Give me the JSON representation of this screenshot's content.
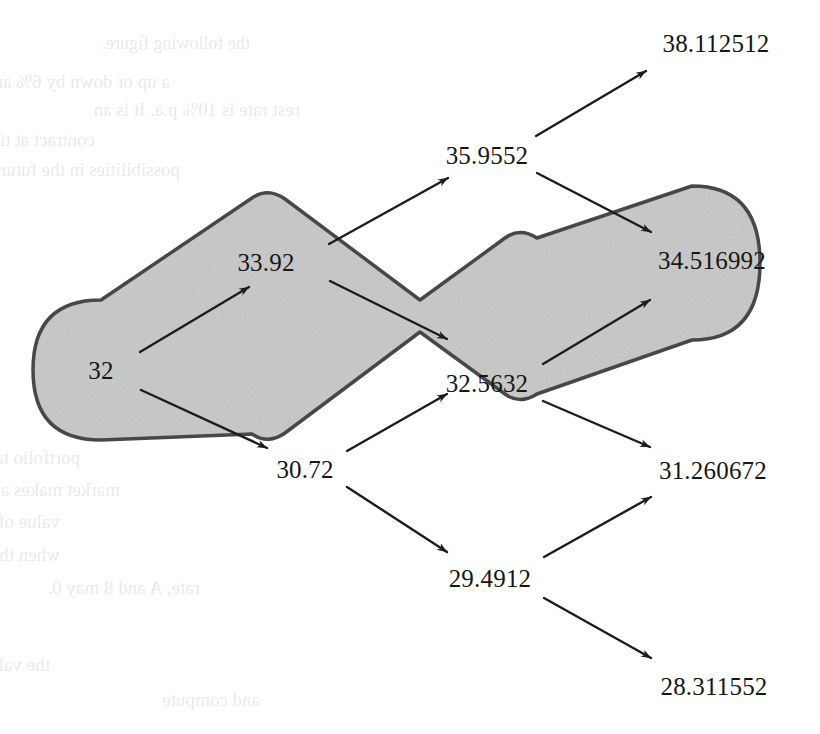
{
  "figure": {
    "width": 820,
    "height": 734,
    "background": "#ffffff",
    "band_fill": "#cdcdcd",
    "band_stroke": "#4a4a4a",
    "arrow_color": "#1c1c1c",
    "text_color": "#161616"
  },
  "chart_data": {
    "type": "diagram",
    "subtype": "binomial-lattice",
    "title": "",
    "xlabel": "",
    "ylabel": "",
    "initial_value": "32",
    "up_factor": 1.06,
    "down_factor": 0.96,
    "steps": 3,
    "nodes": [
      {
        "id": "n0",
        "label": "32",
        "value": 32,
        "step": 0,
        "level": 0,
        "x": 101,
        "y": 370,
        "inside_band": true
      },
      {
        "id": "n1u",
        "label": "33.92",
        "value": 33.92,
        "step": 1,
        "level": 1,
        "x": 266,
        "y": 262,
        "inside_band": true
      },
      {
        "id": "n1d",
        "label": "30.72",
        "value": 30.72,
        "step": 1,
        "level": -1,
        "x": 305,
        "y": 469,
        "inside_band": false
      },
      {
        "id": "n2u",
        "label": "35.9552",
        "value": 35.9552,
        "step": 2,
        "level": 2,
        "x": 487,
        "y": 155,
        "inside_band": false
      },
      {
        "id": "n2m",
        "label": "32.5632",
        "value": 32.5632,
        "step": 2,
        "level": 0,
        "x": 487,
        "y": 383,
        "inside_band": true
      },
      {
        "id": "n2d",
        "label": "29.4912",
        "value": 29.4912,
        "step": 2,
        "level": -2,
        "x": 490,
        "y": 578,
        "inside_band": false
      },
      {
        "id": "n3uu",
        "label": "38.112512",
        "value": 38.112512,
        "step": 3,
        "level": 3,
        "x": 716,
        "y": 43,
        "inside_band": false
      },
      {
        "id": "n3ud",
        "label": "34.516992",
        "value": 34.516992,
        "step": 3,
        "level": 1,
        "x": 712,
        "y": 260,
        "inside_band": true
      },
      {
        "id": "n3du",
        "label": "31.260672",
        "value": 31.260672,
        "step": 3,
        "level": -1,
        "x": 713,
        "y": 470,
        "inside_band": false
      },
      {
        "id": "n3dd",
        "label": "28.311552",
        "value": 28.311552,
        "step": 3,
        "level": -3,
        "x": 714,
        "y": 686,
        "inside_band": false
      }
    ],
    "edges": [
      {
        "from": "n0",
        "to": "n1u",
        "direction": "up",
        "x1": 140,
        "y1": 352,
        "x2": 249,
        "y2": 287
      },
      {
        "from": "n0",
        "to": "n1d",
        "direction": "down",
        "x1": 141,
        "y1": 390,
        "x2": 267,
        "y2": 448
      },
      {
        "from": "n1u",
        "to": "n2u",
        "direction": "up",
        "x1": 329,
        "y1": 244,
        "x2": 448,
        "y2": 178
      },
      {
        "from": "n1u",
        "to": "n2m",
        "direction": "down",
        "x1": 330,
        "y1": 281,
        "x2": 447,
        "y2": 339
      },
      {
        "from": "n1d",
        "to": "n2m",
        "direction": "up",
        "x1": 347,
        "y1": 451,
        "x2": 447,
        "y2": 394
      },
      {
        "from": "n1d",
        "to": "n2d",
        "direction": "down",
        "x1": 347,
        "y1": 487,
        "x2": 447,
        "y2": 552
      },
      {
        "from": "n2u",
        "to": "n3uu",
        "direction": "up",
        "x1": 536,
        "y1": 136,
        "x2": 646,
        "y2": 71
      },
      {
        "from": "n2u",
        "to": "n3ud",
        "direction": "down",
        "x1": 537,
        "y1": 173,
        "x2": 651,
        "y2": 232
      },
      {
        "from": "n2m",
        "to": "n3ud",
        "direction": "up",
        "x1": 543,
        "y1": 364,
        "x2": 650,
        "y2": 300
      },
      {
        "from": "n2m",
        "to": "n3du",
        "direction": "down",
        "x1": 543,
        "y1": 401,
        "x2": 650,
        "y2": 447
      },
      {
        "from": "n2d",
        "to": "n3du",
        "direction": "up",
        "x1": 544,
        "y1": 557,
        "x2": 651,
        "y2": 497
      },
      {
        "from": "n2d",
        "to": "n3dd",
        "direction": "down",
        "x1": 544,
        "y1": 598,
        "x2": 651,
        "y2": 658
      }
    ],
    "band": {
      "description": "shaded zig-zag band with rounded end caps enclosing the recombining path 32 -> 33.92 -> 32.5632 -> 34.516992",
      "fill": "#cdcdcd",
      "stroke": "#4a4a4a",
      "stroke_width": 3.5
    },
    "legend": [],
    "annotations": []
  },
  "bleed_through": {
    "note": "faint mirrored text showing through from the reverse of the printed page",
    "lines": [
      {
        "text": "the following figure.",
        "x": 250,
        "y": 34,
        "size": 18
      },
      {
        "text": "a up or down by 6% and 4%",
        "x": 170,
        "y": 72,
        "size": 19
      },
      {
        "text": "rest rate is 10% p.a. It is an",
        "x": 300,
        "y": 100,
        "size": 19
      },
      {
        "text": "contract at time 1 and 2 are the values",
        "x": 95,
        "y": 130,
        "size": 19
      },
      {
        "text": "possibilities in the future figure.",
        "x": 180,
        "y": 160,
        "size": 19
      },
      {
        "text": "portfolio takes the hedged value, lower at the",
        "x": 80,
        "y": 448,
        "size": 19
      },
      {
        "text": "market makes a shade a minute Θ a means",
        "x": 120,
        "y": 480,
        "size": 19
      },
      {
        "text": "value of the option at each of the four",
        "x": 60,
        "y": 512,
        "size": 19
      },
      {
        "text": "when the portfolio is displayed, under the",
        "x": 60,
        "y": 545,
        "size": 19
      },
      {
        "text": "rate, A and 8 may 0.",
        "x": 200,
        "y": 578,
        "size": 19
      },
      {
        "text": "the value of a option is smaller  1 and all the",
        "x": 50,
        "y": 655,
        "size": 19
      },
      {
        "text": "and  compute",
        "x": 260,
        "y": 690,
        "size": 19
      }
    ]
  }
}
